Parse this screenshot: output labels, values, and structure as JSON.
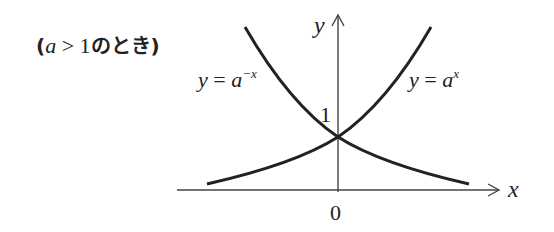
{
  "caption": {
    "open": "(",
    "var": "a",
    "op": " > ",
    "num": "1",
    "jp": "のとき",
    "close": ")"
  },
  "axes": {
    "x_label": "x",
    "y_label": "y",
    "origin_label": "0",
    "y_intercept_label": "1"
  },
  "curves": [
    {
      "name": "exp-growth",
      "lhs": "y",
      "eq": " = ",
      "base": "a",
      "exponent": "x"
    },
    {
      "name": "exp-decay",
      "lhs": "y",
      "eq": " = ",
      "base": "a",
      "exponent": "−x"
    }
  ],
  "colors": {
    "stroke": "#222222",
    "axis": "#444444",
    "background": "#ffffff"
  }
}
